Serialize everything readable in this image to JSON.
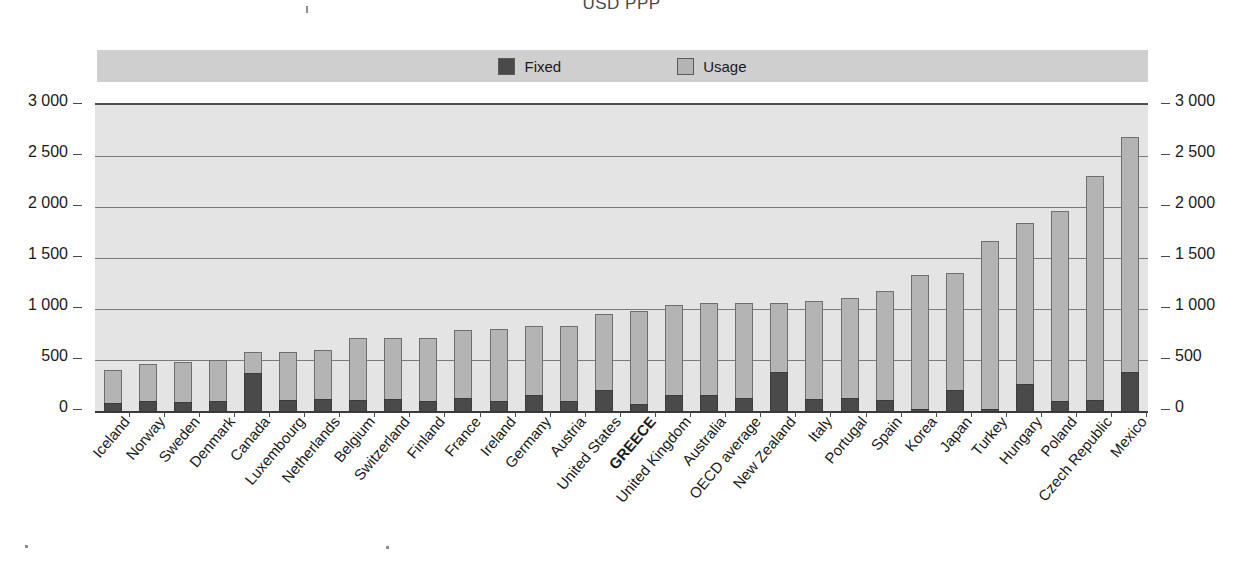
{
  "chart": {
    "title": "USD PPP",
    "legend": {
      "position": "top",
      "items": [
        {
          "label": "Fixed",
          "color": "#4a4a4a",
          "key": "fixed"
        },
        {
          "label": "Usage",
          "color": "#b4b4b4",
          "key": "usage"
        }
      ]
    },
    "y_axis": {
      "ticks": [
        "0",
        "500",
        "1 000",
        "1 500",
        "2 000",
        "2 500",
        "3 000"
      ],
      "min": 0,
      "max": 3000,
      "duplicated_on_right": true
    }
  },
  "chart_data": {
    "type": "bar",
    "subtype": "stacked",
    "title": "USD PPP",
    "xlabel": "",
    "ylabel": "USD PPP",
    "ylim": [
      0,
      3000
    ],
    "ytick_values": [
      0,
      500,
      1000,
      1500,
      2000,
      2500,
      3000
    ],
    "ytick_labels": [
      "0",
      "500",
      "1 000",
      "1 500",
      "2 000",
      "2 500",
      "3 000"
    ],
    "grid": true,
    "legend_position": "top",
    "highlight_category": "GREECE",
    "categories": [
      "Iceland",
      "Norway",
      "Sweden",
      "Denmark",
      "Canada",
      "Luxembourg",
      "Netherlands",
      "Belgium",
      "Switzerland",
      "Finland",
      "France",
      "Ireland",
      "Germany",
      "Austria",
      "United States",
      "GREECE",
      "United Kingdom",
      "Australia",
      "OECD average",
      "New Zealand",
      "Italy",
      "Portugal",
      "Spain",
      "Korea",
      "Japan",
      "Turkey",
      "Hungary",
      "Poland",
      "Czech Republic",
      "Mexico"
    ],
    "series": [
      {
        "name": "Fixed",
        "color": "#4a4a4a",
        "values": [
          75,
          95,
          90,
          95,
          375,
          105,
          120,
          105,
          120,
          95,
          130,
          95,
          160,
          95,
          205,
          65,
          155,
          155,
          130,
          380,
          120,
          125,
          110,
          20,
          210,
          15,
          265,
          100,
          110,
          380
        ]
      },
      {
        "name": "Usage",
        "color": "#b4b4b4",
        "values": [
          330,
          365,
          395,
          405,
          205,
          475,
          480,
          610,
          600,
          620,
          665,
          710,
          670,
          740,
          750,
          920,
          885,
          905,
          925,
          680,
          960,
          980,
          1070,
          1310,
          1140,
          1655,
          1580,
          1860,
          2190,
          2310
        ]
      }
    ],
    "totals": [
      405,
      460,
      485,
      500,
      580,
      580,
      600,
      715,
      720,
      715,
      795,
      805,
      830,
      835,
      955,
      985,
      1040,
      1060,
      1055,
      1060,
      1080,
      1105,
      1180,
      1330,
      1350,
      1670,
      1845,
      1960,
      2300,
      2690
    ]
  }
}
